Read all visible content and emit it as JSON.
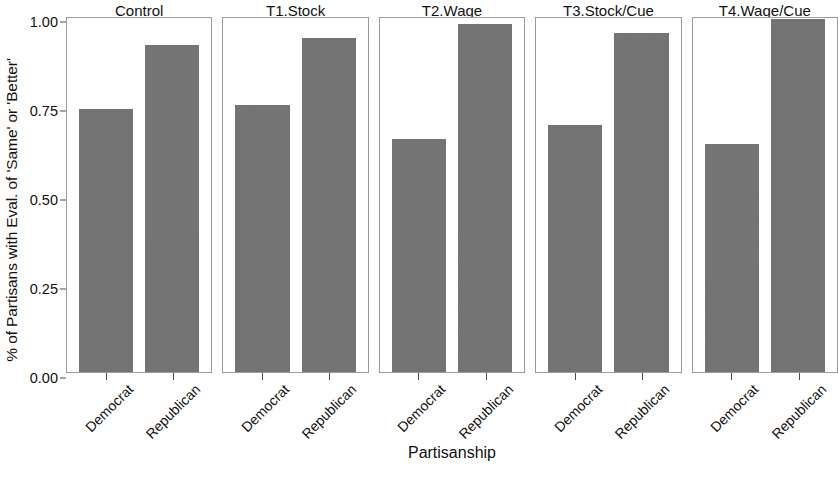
{
  "chart_data": {
    "type": "bar",
    "title": "",
    "xlabel": "Partisanship",
    "ylabel": "% of Partisans with Eval. of 'Same' or 'Better'",
    "ylim": [
      0.0,
      1.0
    ],
    "grid": false,
    "legend": "none",
    "facet_variable": "condition",
    "categories": [
      "Democrat",
      "Republican"
    ],
    "y_ticks": [
      "0.00",
      "0.25",
      "0.50",
      "0.75",
      "1.00"
    ],
    "y_tick_values": [
      0.0,
      0.25,
      0.5,
      0.75,
      1.0
    ],
    "bar_color": "#737373",
    "panel_border_color": "#9a9a9a",
    "panels": [
      {
        "title": "Control",
        "bars": [
          {
            "category": "Democrat",
            "value": 0.745
          },
          {
            "category": "Republican",
            "value": 0.925
          }
        ]
      },
      {
        "title": "T1.Stock",
        "bars": [
          {
            "category": "Democrat",
            "value": 0.755
          },
          {
            "category": "Republican",
            "value": 0.945
          }
        ]
      },
      {
        "title": "T2.Wage",
        "bars": [
          {
            "category": "Democrat",
            "value": 0.66
          },
          {
            "category": "Republican",
            "value": 0.985
          }
        ]
      },
      {
        "title": "T3.Stock/Cue",
        "bars": [
          {
            "category": "Democrat",
            "value": 0.7
          },
          {
            "category": "Republican",
            "value": 0.96
          }
        ]
      },
      {
        "title": "T4.Wage/Cue",
        "bars": [
          {
            "category": "Democrat",
            "value": 0.645
          },
          {
            "category": "Republican",
            "value": 0.998
          }
        ]
      }
    ]
  }
}
